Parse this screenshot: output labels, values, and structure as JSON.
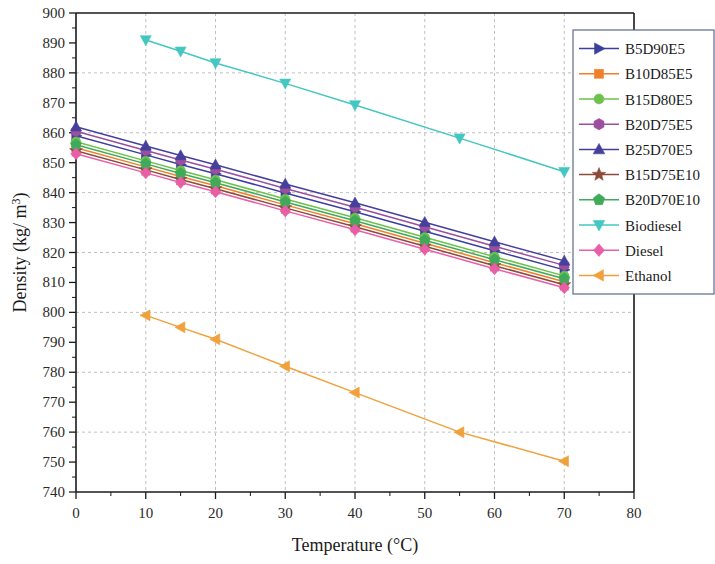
{
  "chart_data": {
    "type": "line",
    "title": "",
    "xlabel": "Temperature (°C)",
    "ylabel": "Density (kg/ m³)",
    "xlim": [
      0,
      80
    ],
    "ylim": [
      740,
      900
    ],
    "xticks": [
      0,
      10,
      20,
      30,
      40,
      50,
      60,
      70,
      80
    ],
    "yticks": [
      740,
      750,
      760,
      770,
      780,
      790,
      800,
      810,
      820,
      830,
      840,
      850,
      860,
      870,
      880,
      890,
      900
    ],
    "xtick_labels": [
      "0",
      "10",
      "20",
      "30",
      "40",
      "50",
      "60",
      "70",
      "80"
    ],
    "ytick_labels": [
      "740",
      "750",
      "760",
      "770",
      "780",
      "790",
      "800",
      "810",
      "820",
      "830",
      "840",
      "850",
      "860",
      "870",
      "880",
      "890",
      "900"
    ],
    "grid": true,
    "legend_position": "right",
    "series": [
      {
        "name": "B5D90E5",
        "color": "#3b3f9e",
        "marker": "triangle-right",
        "x": [
          0,
          10,
          15,
          20,
          30,
          40,
          50,
          60,
          70
        ],
        "y": [
          859.0,
          852.6,
          849.4,
          846.3,
          839.9,
          833.6,
          827.1,
          820.6,
          814.2
        ]
      },
      {
        "name": "B10D85E5",
        "color": "#f07f29",
        "marker": "square",
        "x": [
          0,
          10,
          15,
          20,
          30,
          40,
          50,
          60,
          70
        ],
        "y": [
          855.0,
          848.6,
          845.4,
          842.3,
          835.9,
          829.6,
          823.1,
          816.6,
          810.2
        ]
      },
      {
        "name": "B15D80E5",
        "color": "#6cc24a",
        "marker": "circle",
        "x": [
          0,
          10,
          15,
          20,
          30,
          40,
          50,
          60,
          70
        ],
        "y": [
          857.0,
          850.6,
          847.4,
          844.3,
          837.9,
          831.6,
          825.1,
          818.6,
          812.2
        ]
      },
      {
        "name": "B20D75E5",
        "color": "#9b4f9e",
        "marker": "hexagon",
        "x": [
          0,
          10,
          15,
          20,
          30,
          40,
          50,
          60,
          70
        ],
        "y": [
          860.5,
          854.1,
          850.9,
          847.8,
          841.4,
          835.1,
          828.6,
          822.1,
          815.7
        ]
      },
      {
        "name": "B25D70E5",
        "color": "#45409c",
        "marker": "triangle-up",
        "x": [
          0,
          10,
          15,
          20,
          30,
          40,
          50,
          60,
          70
        ],
        "y": [
          862.0,
          855.6,
          852.4,
          849.3,
          842.9,
          836.6,
          830.1,
          823.6,
          817.2
        ]
      },
      {
        "name": "B15D75E10",
        "color": "#8c4a3a",
        "marker": "star",
        "x": [
          0,
          10,
          15,
          20,
          30,
          40,
          50,
          60,
          70
        ],
        "y": [
          854.0,
          847.6,
          844.4,
          841.3,
          834.9,
          828.6,
          822.1,
          815.6,
          809.2
        ]
      },
      {
        "name": "B20D70E10",
        "color": "#3eaa5a",
        "marker": "pentagon",
        "x": [
          0,
          10,
          15,
          20,
          30,
          40,
          50,
          60,
          70
        ],
        "y": [
          856.0,
          849.6,
          846.4,
          843.3,
          836.9,
          830.6,
          824.1,
          817.6,
          811.2
        ]
      },
      {
        "name": "Biodiesel",
        "color": "#43c7c0",
        "marker": "triangle-down",
        "x": [
          10,
          15,
          20,
          30,
          40,
          55,
          70
        ],
        "y": [
          891.0,
          887.2,
          883.3,
          876.5,
          869.3,
          858.2,
          847.0
        ]
      },
      {
        "name": "Diesel",
        "color": "#e85fa8",
        "marker": "diamond",
        "x": [
          0,
          10,
          15,
          20,
          30,
          40,
          50,
          60,
          70
        ],
        "y": [
          853.0,
          846.6,
          843.4,
          840.3,
          833.9,
          827.6,
          821.1,
          814.6,
          808.2
        ]
      },
      {
        "name": "Ethanol",
        "color": "#f0a13c",
        "marker": "triangle-left",
        "x": [
          10,
          15,
          20,
          30,
          40,
          55,
          70
        ],
        "y": [
          799.0,
          795.0,
          791.0,
          782.0,
          773.2,
          760.0,
          750.3
        ]
      }
    ]
  }
}
